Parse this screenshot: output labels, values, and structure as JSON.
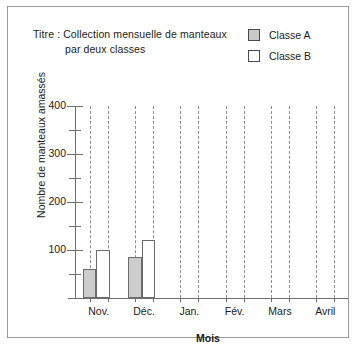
{
  "chart_data": {
    "type": "bar",
    "title": "Titre : Collection mensuelle de manteaux par deux classes",
    "title_line1": "Titre : Collection mensuelle de manteaux",
    "title_line2": "par deux classes",
    "xlabel": "Mois",
    "ylabel": "Nombre de manteaux amassés",
    "categories": [
      "Nov.",
      "Déc.",
      "Jan.",
      "Fév.",
      "Mars",
      "Avril"
    ],
    "series": [
      {
        "name": "Classe A",
        "color": "#cdcdcd",
        "values": [
          60,
          85,
          0,
          0,
          0,
          0
        ]
      },
      {
        "name": "Classe B",
        "color": "#ffffff",
        "values": [
          100,
          120,
          0,
          0,
          0,
          0
        ]
      }
    ],
    "ylim": [
      0,
      400
    ],
    "yticks": [
      0,
      50,
      100,
      150,
      200,
      250,
      300,
      350,
      400
    ],
    "ytick_labels": [
      "",
      "",
      "100",
      "",
      "200",
      "",
      "300",
      "",
      "400"
    ],
    "grid": "vertical-dashed",
    "legend_position": "top-right"
  },
  "legend": {
    "items": [
      {
        "label": "Classe A",
        "swatch": "gray"
      },
      {
        "label": "Classe B",
        "swatch": "white"
      }
    ]
  }
}
